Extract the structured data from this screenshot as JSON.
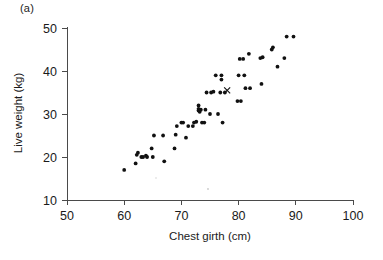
{
  "figure": {
    "panel_label": "(a)",
    "background_color": "#ffffff",
    "point_color": "#111111"
  },
  "chart_data": {
    "type": "scatter",
    "title": "",
    "subtitle": "",
    "panel": "(a)",
    "xlabel": "Chest girth (cm)",
    "ylabel": "Live weight (kg)",
    "xlim": [
      50,
      100
    ],
    "ylim": [
      10,
      50
    ],
    "xticks": [
      50,
      60,
      70,
      80,
      90,
      100
    ],
    "yticks": [
      10,
      20,
      30,
      40,
      50
    ],
    "xtick_labels": [
      "50",
      "60",
      "70",
      "80",
      "90",
      "100"
    ],
    "ytick_labels": [
      "10",
      "20",
      "30",
      "40",
      "50"
    ],
    "grid": false,
    "legend": null,
    "legend_position": "none",
    "series": [
      {
        "name": "observations",
        "marker": "filled-circle",
        "color": "#111111",
        "points": [
          [
            60.0,
            17.0
          ],
          [
            62.0,
            18.5
          ],
          [
            62.2,
            20.5
          ],
          [
            62.4,
            21.0
          ],
          [
            63.0,
            20.0
          ],
          [
            63.3,
            20.0
          ],
          [
            63.8,
            20.3
          ],
          [
            64.0,
            20.0
          ],
          [
            64.8,
            22.0
          ],
          [
            65.0,
            20.0
          ],
          [
            65.2,
            25.0
          ],
          [
            66.8,
            25.0
          ],
          [
            67.0,
            19.0
          ],
          [
            68.8,
            22.0
          ],
          [
            69.0,
            25.2
          ],
          [
            69.2,
            27.2
          ],
          [
            70.0,
            28.0
          ],
          [
            70.3,
            28.0
          ],
          [
            70.8,
            24.5
          ],
          [
            71.2,
            27.2
          ],
          [
            72.0,
            27.2
          ],
          [
            72.2,
            28.0
          ],
          [
            72.6,
            28.2
          ],
          [
            73.0,
            30.8
          ],
          [
            73.0,
            31.2
          ],
          [
            73.0,
            32.0
          ],
          [
            73.2,
            30.5
          ],
          [
            73.4,
            31.0
          ],
          [
            73.6,
            28.0
          ],
          [
            74.0,
            28.0
          ],
          [
            74.2,
            31.0
          ],
          [
            74.4,
            35.0
          ],
          [
            75.0,
            30.0
          ],
          [
            75.2,
            35.0
          ],
          [
            75.6,
            35.2
          ],
          [
            76.0,
            39.0
          ],
          [
            76.4,
            30.0
          ],
          [
            76.8,
            35.0
          ],
          [
            77.0,
            38.0
          ],
          [
            77.0,
            39.0
          ],
          [
            77.2,
            28.0
          ],
          [
            77.6,
            35.0
          ],
          [
            79.8,
            33.0
          ],
          [
            80.0,
            39.0
          ],
          [
            80.2,
            42.8
          ],
          [
            80.4,
            33.0
          ],
          [
            80.8,
            42.8
          ],
          [
            81.0,
            39.0
          ],
          [
            81.2,
            36.0
          ],
          [
            81.8,
            44.0
          ],
          [
            82.0,
            36.0
          ],
          [
            83.8,
            43.0
          ],
          [
            84.0,
            37.0
          ],
          [
            84.2,
            43.2
          ],
          [
            85.8,
            45.0
          ],
          [
            86.0,
            45.5
          ],
          [
            86.8,
            41.0
          ],
          [
            88.0,
            43.0
          ],
          [
            88.4,
            48.0
          ],
          [
            89.6,
            48.0
          ]
        ]
      },
      {
        "name": "highlighted-individual",
        "marker": "x",
        "color": "#111111",
        "points": [
          [
            78.0,
            35.5
          ]
        ]
      }
    ]
  }
}
